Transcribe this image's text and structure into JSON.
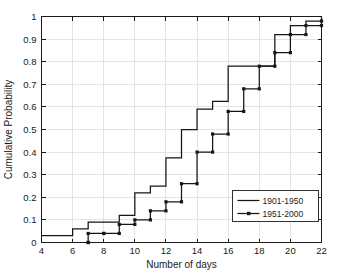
{
  "chart_data": {
    "type": "line",
    "title": "",
    "xlabel": "Number of days",
    "ylabel": "Cumulative Probability",
    "xlim": [
      4,
      22
    ],
    "ylim": [
      0,
      1
    ],
    "xticks": [
      4,
      6,
      8,
      10,
      12,
      14,
      16,
      18,
      20,
      22
    ],
    "xtick_labels": [
      "4",
      "6",
      "8",
      "10",
      "12",
      "14",
      "16",
      "18",
      "20",
      "22"
    ],
    "yticks": [
      0,
      0.1,
      0.2,
      0.3,
      0.4,
      0.5,
      0.6,
      0.7,
      0.8,
      0.9,
      1
    ],
    "ytick_labels": [
      "0",
      "0.1",
      "0.2",
      "0.3",
      "0.4",
      "0.5",
      "0.6",
      "0.7",
      "0.8",
      "0.9",
      "1"
    ],
    "grid": true,
    "legend_position": "lower-right",
    "drawstyle": "steps-post",
    "series": [
      {
        "name": "1901-1950",
        "marker": "none",
        "color": "#161616",
        "x": [
          4,
          6,
          7,
          9,
          10,
          11,
          12,
          13,
          14,
          15,
          16,
          19,
          20,
          21,
          22
        ],
        "y": [
          0.03,
          0.06,
          0.09,
          0.12,
          0.22,
          0.25,
          0.375,
          0.5,
          0.59,
          0.625,
          0.78,
          0.92,
          0.96,
          0.98,
          1.0
        ]
      },
      {
        "name": "1951-2000",
        "marker": "square",
        "color": "#161616",
        "x": [
          7,
          7,
          8,
          9,
          10,
          11,
          12,
          13,
          14,
          15,
          16,
          17,
          18,
          19,
          20,
          21,
          22
        ],
        "y": [
          0.0,
          0.04,
          0.04,
          0.08,
          0.1,
          0.14,
          0.18,
          0.26,
          0.4,
          0.48,
          0.58,
          0.68,
          0.78,
          0.84,
          0.92,
          0.96,
          0.98
        ]
      }
    ]
  },
  "legend": {
    "entries": [
      {
        "label": "1901-1950"
      },
      {
        "label": "1951-2000"
      }
    ]
  },
  "colors": {
    "background": "#ffffff",
    "axis": "#1a1a1a",
    "grid": "#d9d9d9",
    "series": "#161616"
  }
}
